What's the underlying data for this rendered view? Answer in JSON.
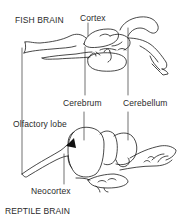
{
  "diagram": {
    "fish": {
      "title": "FISH BRAIN",
      "labels": {
        "cortex": "Cortex"
      }
    },
    "shared_labels": {
      "cerebrum": "Cerebrum",
      "cerebellum": "Cerebellum",
      "olfactory_lobe": "Olfactory lobe"
    },
    "reptile": {
      "title": "REPTILE BRAIN",
      "labels": {
        "neocortex": "Neocortex"
      }
    },
    "colors": {
      "ink": "#1a1a1a",
      "background": "#ffffff"
    }
  }
}
